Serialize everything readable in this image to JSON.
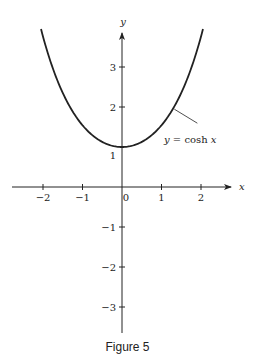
{
  "caption": "Figure 5",
  "colors": {
    "ink": "#222222",
    "background": "#ffffff"
  },
  "chart_data": {
    "type": "line",
    "title": "",
    "caption": "Figure 5",
    "xlabel": "x",
    "ylabel": "y",
    "xlim": [
      -2.6,
      2.7
    ],
    "ylim": [
      -3.6,
      4.0
    ],
    "grid": false,
    "legend": null,
    "x_ticks": [
      -2,
      -1,
      0,
      1,
      2
    ],
    "x_tick_labels": [
      "−2",
      "−1",
      "0",
      "1",
      "2"
    ],
    "y_ticks": [
      -3,
      -2,
      -1,
      1,
      2,
      3
    ],
    "y_tick_labels": [
      "−3",
      "−2",
      "−1",
      "1",
      "2",
      "3"
    ],
    "series": [
      {
        "name": "y = cosh x",
        "function": "cosh(x)",
        "x": [
          -2.05,
          -1.5,
          -1,
          -0.5,
          0,
          0.5,
          1,
          1.5,
          2.05
        ],
        "values": [
          3.95,
          2.35,
          1.54,
          1.13,
          1.0,
          1.13,
          1.54,
          2.35,
          3.95
        ]
      }
    ],
    "annotations": [
      {
        "text": "y = cosh x",
        "points_to": {
          "x": 1.3,
          "y": 1.97
        },
        "type": "leader-line"
      }
    ]
  }
}
